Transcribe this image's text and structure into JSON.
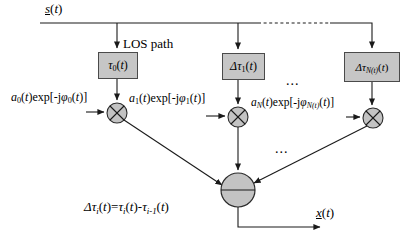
{
  "colors": {
    "line-color": "#1a1a1a",
    "text-color": "#000000",
    "box-fill": "#c6c6c6",
    "box-border": "#4a4a4a",
    "node-fill": "#c3c3c3",
    "node-border": "#2b2b2b",
    "background": "#ffffff"
  },
  "symbols": {
    "multiplier_icon": "circle-with-x",
    "adder_icon": "circle-with-horizontal-line",
    "arrowhead_icon": "solid-triangle"
  },
  "labels": {
    "los_path": "LOS path",
    "ellipsis_top": "...",
    "ellipsis_mid": "...",
    "input_signal": {
      "segs": [
        {
          "t": "s",
          "c": "iu"
        },
        {
          "t": "(",
          "c": ""
        },
        {
          "t": "t",
          "c": "i"
        },
        {
          "t": ")",
          "c": ""
        }
      ]
    },
    "delay_0": {
      "segs": [
        {
          "t": "τ",
          "c": "i"
        },
        {
          "t": "0",
          "c": "s"
        },
        {
          "t": "(",
          "c": ""
        },
        {
          "t": "t",
          "c": "i"
        },
        {
          "t": ")",
          "c": ""
        }
      ]
    },
    "delay_1": {
      "segs": [
        {
          "t": "Δτ",
          "c": "i"
        },
        {
          "t": "1",
          "c": "s"
        },
        {
          "t": "(",
          "c": ""
        },
        {
          "t": "t",
          "c": "i"
        },
        {
          "t": ")",
          "c": ""
        }
      ]
    },
    "delay_n": {
      "segs": [
        {
          "t": "Δτ",
          "c": "i"
        },
        {
          "t": "N(t)",
          "c": "is"
        },
        {
          "t": "(",
          "c": ""
        },
        {
          "t": "t",
          "c": "i"
        },
        {
          "t": ")",
          "c": ""
        }
      ]
    },
    "gain_0": {
      "segs": [
        {
          "t": "a",
          "c": "i"
        },
        {
          "t": "0",
          "c": "s"
        },
        {
          "t": "(",
          "c": ""
        },
        {
          "t": "t",
          "c": "i"
        },
        {
          "t": ")exp[-j",
          "c": ""
        },
        {
          "t": "φ",
          "c": "i"
        },
        {
          "t": "0",
          "c": "s"
        },
        {
          "t": "(",
          "c": ""
        },
        {
          "t": "t",
          "c": "i"
        },
        {
          "t": ")]",
          "c": ""
        }
      ]
    },
    "gain_1": {
      "segs": [
        {
          "t": "a",
          "c": "i"
        },
        {
          "t": "1",
          "c": "s"
        },
        {
          "t": "(",
          "c": ""
        },
        {
          "t": "t",
          "c": "i"
        },
        {
          "t": ")exp[-j",
          "c": ""
        },
        {
          "t": "φ",
          "c": "i"
        },
        {
          "t": "1",
          "c": "s"
        },
        {
          "t": "(",
          "c": ""
        },
        {
          "t": "t",
          "c": "i"
        },
        {
          "t": ")]",
          "c": ""
        }
      ]
    },
    "gain_n": {
      "segs": [
        {
          "t": "a",
          "c": "i"
        },
        {
          "t": "N",
          "c": "is"
        },
        {
          "t": "(",
          "c": ""
        },
        {
          "t": "t",
          "c": "i"
        },
        {
          "t": ")exp[-j",
          "c": ""
        },
        {
          "t": "φ",
          "c": "i"
        },
        {
          "t": "N(t)",
          "c": "is"
        },
        {
          "t": "(",
          "c": ""
        },
        {
          "t": "t",
          "c": "i"
        },
        {
          "t": ")]",
          "c": ""
        }
      ]
    },
    "formula": {
      "segs": [
        {
          "t": "Δτ",
          "c": "i"
        },
        {
          "t": "i",
          "c": "is"
        },
        {
          "t": "(",
          "c": ""
        },
        {
          "t": "t",
          "c": "i"
        },
        {
          "t": ")=",
          "c": ""
        },
        {
          "t": "τ",
          "c": "i"
        },
        {
          "t": "i",
          "c": "is"
        },
        {
          "t": "(",
          "c": ""
        },
        {
          "t": "t",
          "c": "i"
        },
        {
          "t": ")-",
          "c": ""
        },
        {
          "t": "τ",
          "c": "i"
        },
        {
          "t": "i-1",
          "c": "is"
        },
        {
          "t": "(",
          "c": ""
        },
        {
          "t": "t",
          "c": "i"
        },
        {
          "t": ")",
          "c": ""
        }
      ]
    },
    "output_signal": {
      "segs": [
        {
          "t": "x",
          "c": "iu"
        },
        {
          "t": "(",
          "c": ""
        },
        {
          "t": "t",
          "c": "i"
        },
        {
          "t": ")",
          "c": ""
        }
      ]
    }
  }
}
